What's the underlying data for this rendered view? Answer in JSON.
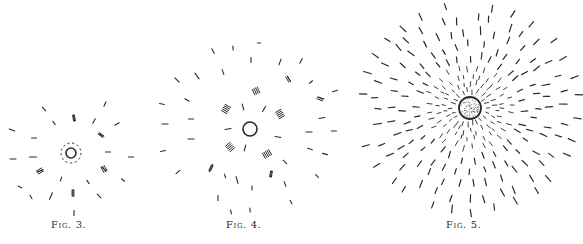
{
  "page": {
    "background": "#ffffff",
    "ink": "#2a2a2a"
  },
  "figures": [
    {
      "id": "fig3",
      "caption": "Fig. 3.",
      "caption_pos": {
        "x": 51,
        "y": 219
      },
      "center": {
        "x": 71,
        "y": 153
      },
      "ring_radius": 5,
      "ring_stroke": 1.6,
      "inner_dashed_ring_radius": 10,
      "stippled": false,
      "dashes": [
        {
          "x": 44,
          "y": 109,
          "len": 5,
          "angle": 50
        },
        {
          "x": 105,
          "y": 104,
          "len": 5,
          "angle": -65
        },
        {
          "x": 74,
          "y": 118,
          "len": 6,
          "angle": 80
        },
        {
          "x": 54,
          "y": 123,
          "len": 4,
          "angle": 55
        },
        {
          "x": 94,
          "y": 121,
          "len": 5,
          "angle": -60
        },
        {
          "x": 117,
          "y": 124,
          "len": 5,
          "angle": -30
        },
        {
          "x": 12,
          "y": 130,
          "len": 6,
          "angle": 20
        },
        {
          "x": 34,
          "y": 138,
          "len": 5,
          "angle": 0
        },
        {
          "x": 101,
          "y": 135,
          "len": 5,
          "angle": 35
        },
        {
          "x": 108,
          "y": 152,
          "len": 5,
          "angle": 0
        },
        {
          "x": 131,
          "y": 157,
          "len": 5,
          "angle": 0
        },
        {
          "x": 13,
          "y": 159,
          "len": 6,
          "angle": 0
        },
        {
          "x": 33,
          "y": 157,
          "len": 7,
          "angle": 0
        },
        {
          "x": 40,
          "y": 171,
          "len": 6,
          "angle": -20
        },
        {
          "x": 104,
          "y": 169,
          "len": 6,
          "angle": 40
        },
        {
          "x": 61,
          "y": 179,
          "len": 4,
          "angle": -70
        },
        {
          "x": 88,
          "y": 182,
          "len": 4,
          "angle": 55
        },
        {
          "x": 123,
          "y": 180,
          "len": 4,
          "angle": 40
        },
        {
          "x": 20,
          "y": 187,
          "len": 4,
          "angle": 30
        },
        {
          "x": 31,
          "y": 197,
          "len": 4,
          "angle": 60
        },
        {
          "x": 51,
          "y": 196,
          "len": 7,
          "angle": -65
        },
        {
          "x": 73,
          "y": 193,
          "len": 7,
          "angle": 90
        },
        {
          "x": 99,
          "y": 196,
          "len": 5,
          "angle": 45
        },
        {
          "x": 74,
          "y": 213,
          "len": 5,
          "angle": 90
        }
      ],
      "hatches": [
        {
          "x": 74,
          "y": 118,
          "n": 2,
          "angle": 80
        },
        {
          "x": 101,
          "y": 135,
          "n": 2,
          "angle": 35
        },
        {
          "x": 104,
          "y": 169,
          "n": 3,
          "angle": 60
        },
        {
          "x": 40,
          "y": 171,
          "n": 3,
          "angle": -30
        },
        {
          "x": 73,
          "y": 193,
          "n": 2,
          "angle": 90
        }
      ]
    },
    {
      "id": "fig4",
      "caption": "Fig. 4.",
      "caption_pos": {
        "x": 226,
        "y": 219
      },
      "center": {
        "x": 250,
        "y": 129
      },
      "ring_radius": 7,
      "ring_stroke": 1.6,
      "inner_dashed_ring_radius": 0,
      "stippled": false,
      "dashes": [
        {
          "x": 259,
          "y": 43,
          "len": 3,
          "angle": 0
        },
        {
          "x": 213,
          "y": 51,
          "len": 5,
          "angle": 60
        },
        {
          "x": 233,
          "y": 48,
          "len": 4,
          "angle": 85
        },
        {
          "x": 251,
          "y": 60,
          "len": 5,
          "angle": 90
        },
        {
          "x": 280,
          "y": 62,
          "len": 6,
          "angle": -70
        },
        {
          "x": 301,
          "y": 61,
          "len": 5,
          "angle": -60
        },
        {
          "x": 177,
          "y": 80,
          "len": 6,
          "angle": 45
        },
        {
          "x": 197,
          "y": 76,
          "len": 7,
          "angle": 55
        },
        {
          "x": 223,
          "y": 72,
          "len": 5,
          "angle": 70
        },
        {
          "x": 289,
          "y": 79,
          "len": 6,
          "angle": 60
        },
        {
          "x": 311,
          "y": 82,
          "len": 4,
          "angle": -40
        },
        {
          "x": 335,
          "y": 91,
          "len": 5,
          "angle": -20
        },
        {
          "x": 162,
          "y": 104,
          "len": 5,
          "angle": 10
        },
        {
          "x": 187,
          "y": 100,
          "len": 5,
          "angle": 30
        },
        {
          "x": 243,
          "y": 107,
          "len": 6,
          "angle": 75
        },
        {
          "x": 264,
          "y": 109,
          "len": 6,
          "angle": -60
        },
        {
          "x": 321,
          "y": 98,
          "len": 6,
          "angle": 20
        },
        {
          "x": 191,
          "y": 119,
          "len": 5,
          "angle": 0
        },
        {
          "x": 322,
          "y": 118,
          "len": 6,
          "angle": -10
        },
        {
          "x": 165,
          "y": 124,
          "len": 6,
          "angle": 0
        },
        {
          "x": 228,
          "y": 129,
          "len": 6,
          "angle": -10
        },
        {
          "x": 309,
          "y": 132,
          "len": 6,
          "angle": 0
        },
        {
          "x": 334,
          "y": 131,
          "len": 5,
          "angle": 0
        },
        {
          "x": 191,
          "y": 139,
          "len": 6,
          "angle": 0
        },
        {
          "x": 278,
          "y": 137,
          "len": 6,
          "angle": 10
        },
        {
          "x": 163,
          "y": 151,
          "len": 5,
          "angle": -10
        },
        {
          "x": 245,
          "y": 148,
          "len": 6,
          "angle": -75
        },
        {
          "x": 310,
          "y": 149,
          "len": 5,
          "angle": 20
        },
        {
          "x": 325,
          "y": 154,
          "len": 5,
          "angle": 15
        },
        {
          "x": 178,
          "y": 172,
          "len": 5,
          "angle": -40
        },
        {
          "x": 211,
          "y": 168,
          "len": 8,
          "angle": -65
        },
        {
          "x": 225,
          "y": 176,
          "len": 4,
          "angle": 70
        },
        {
          "x": 237,
          "y": 180,
          "len": 7,
          "angle": 75
        },
        {
          "x": 271,
          "y": 174,
          "len": 6,
          "angle": -80
        },
        {
          "x": 285,
          "y": 162,
          "len": 5,
          "angle": 45
        },
        {
          "x": 285,
          "y": 184,
          "len": 5,
          "angle": 70
        },
        {
          "x": 317,
          "y": 176,
          "len": 4,
          "angle": 45
        },
        {
          "x": 252,
          "y": 188,
          "len": 4,
          "angle": 90
        },
        {
          "x": 218,
          "y": 198,
          "len": 5,
          "angle": 90
        },
        {
          "x": 291,
          "y": 202,
          "len": 4,
          "angle": 60
        },
        {
          "x": 231,
          "y": 212,
          "len": 4,
          "angle": 80
        },
        {
          "x": 250,
          "y": 210,
          "len": 4,
          "angle": 85
        }
      ],
      "hatches": [
        {
          "x": 226,
          "y": 109,
          "n": 5,
          "angle": 30
        },
        {
          "x": 280,
          "y": 114,
          "n": 5,
          "angle": -30
        },
        {
          "x": 256,
          "y": 91,
          "n": 4,
          "angle": 65
        },
        {
          "x": 230,
          "y": 147,
          "n": 5,
          "angle": -40
        },
        {
          "x": 267,
          "y": 154,
          "n": 5,
          "angle": 60
        },
        {
          "x": 288,
          "y": 79,
          "n": 2,
          "angle": 60
        },
        {
          "x": 320,
          "y": 99,
          "n": 2,
          "angle": 20
        },
        {
          "x": 271,
          "y": 174,
          "n": 2,
          "angle": -80
        },
        {
          "x": 211,
          "y": 168,
          "n": 2,
          "angle": -65
        }
      ]
    },
    {
      "id": "fig5",
      "caption": "Fig. 5.",
      "caption_pos": {
        "x": 446,
        "y": 219
      },
      "center": {
        "x": 470,
        "y": 108
      },
      "ring_radius": 11,
      "ring_stroke": 1.8,
      "inner_dashed_ring_radius": 0,
      "stippled": true,
      "radial_rings": [
        {
          "radius": 17,
          "count": 22,
          "len": 3,
          "offset": 0
        },
        {
          "radius": 24,
          "count": 26,
          "len": 3,
          "offset": 7
        },
        {
          "radius": 31,
          "count": 28,
          "len": 3,
          "offset": 3
        },
        {
          "radius": 40,
          "count": 28,
          "len": 4,
          "offset": 9
        },
        {
          "radius": 51,
          "count": 30,
          "len": 5,
          "offset": 4
        },
        {
          "radius": 63,
          "count": 32,
          "len": 5,
          "offset": 11
        },
        {
          "radius": 76,
          "count": 34,
          "len": 6,
          "offset": 2
        },
        {
          "radius": 90,
          "count": 34,
          "len": 6,
          "offset": 8
        },
        {
          "radius": 104,
          "count": 30,
          "len": 6,
          "offset": 5
        }
      ],
      "clip": {
        "x0": 362,
        "y0": 4,
        "x1": 583,
        "y1": 214
      }
    }
  ]
}
